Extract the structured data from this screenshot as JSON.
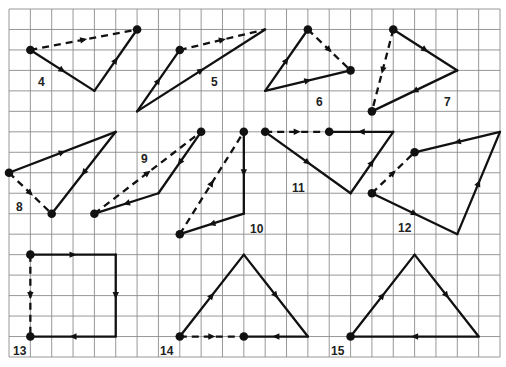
{
  "grid": {
    "columns": 23,
    "rows": 17
  },
  "colors": {
    "ink": "#111111",
    "grid": "#8c8c8c",
    "background": "#ffffff"
  },
  "figures": [
    {
      "label": "4",
      "dots": [
        [
          1,
          2
        ],
        [
          6,
          1
        ]
      ],
      "segments": [
        {
          "from": [
            1,
            2
          ],
          "to": [
            4,
            4
          ],
          "style": "solid"
        },
        {
          "from": [
            4,
            4
          ],
          "to": [
            6,
            1
          ],
          "style": "solid"
        },
        {
          "from": [
            1,
            2
          ],
          "to": [
            6,
            1
          ],
          "style": "dashed"
        }
      ]
    },
    {
      "label": "5",
      "dots": [
        [
          8,
          2
        ]
      ],
      "segments": [
        {
          "from": [
            6,
            5
          ],
          "to": [
            8,
            2
          ],
          "style": "solid"
        },
        {
          "from": [
            6,
            5
          ],
          "to": [
            12,
            1
          ],
          "style": "solid"
        },
        {
          "from": [
            8,
            2
          ],
          "to": [
            12,
            1
          ],
          "style": "dashed"
        }
      ]
    },
    {
      "label": "6",
      "dots": [
        [
          14,
          1
        ],
        [
          16,
          3
        ]
      ],
      "segments": [
        {
          "from": [
            12,
            4
          ],
          "to": [
            14,
            1
          ],
          "style": "solid"
        },
        {
          "from": [
            12,
            4
          ],
          "to": [
            16,
            3
          ],
          "style": "solid"
        },
        {
          "from": [
            14,
            1
          ],
          "to": [
            16,
            3
          ],
          "style": "dashed"
        }
      ]
    },
    {
      "label": "7",
      "dots": [
        [
          18,
          1
        ],
        [
          17,
          5
        ]
      ],
      "segments": [
        {
          "from": [
            18,
            1
          ],
          "to": [
            21,
            3
          ],
          "style": "solid"
        },
        {
          "from": [
            21,
            3
          ],
          "to": [
            17,
            5
          ],
          "style": "solid"
        },
        {
          "from": [
            18,
            1
          ],
          "to": [
            17,
            5
          ],
          "style": "dashed"
        }
      ]
    },
    {
      "label": "8",
      "dots": [
        [
          0,
          8
        ],
        [
          2,
          10
        ]
      ],
      "segments": [
        {
          "from": [
            0,
            8
          ],
          "to": [
            5,
            6
          ],
          "style": "solid"
        },
        {
          "from": [
            5,
            6
          ],
          "to": [
            2,
            10
          ],
          "style": "solid"
        },
        {
          "from": [
            0,
            8
          ],
          "to": [
            2,
            10
          ],
          "style": "dashed"
        }
      ]
    },
    {
      "label": "9",
      "dots": [
        [
          9,
          6
        ],
        [
          4,
          10
        ]
      ],
      "segments": [
        {
          "from": [
            9,
            6
          ],
          "to": [
            7,
            9
          ],
          "style": "solid"
        },
        {
          "from": [
            7,
            9
          ],
          "to": [
            4,
            10
          ],
          "style": "solid"
        },
        {
          "from": [
            4,
            10
          ],
          "to": [
            9,
            6
          ],
          "style": "dashed"
        }
      ]
    },
    {
      "label": "10",
      "dots": [
        [
          11,
          6
        ],
        [
          8,
          11
        ]
      ],
      "segments": [
        {
          "from": [
            11,
            6
          ],
          "to": [
            11,
            10
          ],
          "style": "solid"
        },
        {
          "from": [
            11,
            10
          ],
          "to": [
            8,
            11
          ],
          "style": "solid"
        },
        {
          "from": [
            8,
            11
          ],
          "to": [
            11,
            6
          ],
          "style": "dashed"
        }
      ]
    },
    {
      "label": "11",
      "dots": [
        [
          12,
          6
        ],
        [
          15,
          6
        ]
      ],
      "segments": [
        {
          "from": [
            12,
            6
          ],
          "to": [
            16,
            9
          ],
          "style": "solid"
        },
        {
          "from": [
            16,
            9
          ],
          "to": [
            18,
            6
          ],
          "style": "solid"
        },
        {
          "from": [
            18,
            6
          ],
          "to": [
            15,
            6
          ],
          "style": "solid"
        },
        {
          "from": [
            12,
            6
          ],
          "to": [
            15,
            6
          ],
          "style": "dashed"
        }
      ]
    },
    {
      "label": "12",
      "dots": [
        [
          19,
          7
        ],
        [
          17,
          9
        ]
      ],
      "segments": [
        {
          "from": [
            23,
            6
          ],
          "to": [
            19,
            7
          ],
          "style": "solid"
        },
        {
          "from": [
            17,
            9
          ],
          "to": [
            21,
            11
          ],
          "style": "solid"
        },
        {
          "from": [
            21,
            11
          ],
          "to": [
            23,
            6
          ],
          "style": "solid"
        },
        {
          "from": [
            17,
            9
          ],
          "to": [
            19,
            7
          ],
          "style": "dashed"
        }
      ]
    },
    {
      "label": "13",
      "dots": [
        [
          1,
          12
        ],
        [
          1,
          16
        ]
      ],
      "segments": [
        {
          "from": [
            1,
            12
          ],
          "to": [
            5,
            12
          ],
          "style": "solid"
        },
        {
          "from": [
            5,
            12
          ],
          "to": [
            5,
            16
          ],
          "style": "solid"
        },
        {
          "from": [
            5,
            16
          ],
          "to": [
            1,
            16
          ],
          "style": "solid"
        },
        {
          "from": [
            1,
            12
          ],
          "to": [
            1,
            16
          ],
          "style": "dashed"
        }
      ]
    },
    {
      "label": "14",
      "dots": [
        [
          8,
          16
        ],
        [
          11,
          16
        ]
      ],
      "segments": [
        {
          "from": [
            8,
            16
          ],
          "to": [
            11,
            12
          ],
          "style": "solid"
        },
        {
          "from": [
            11,
            12
          ],
          "to": [
            14,
            16
          ],
          "style": "solid"
        },
        {
          "from": [
            14,
            16
          ],
          "to": [
            11,
            16
          ],
          "style": "solid"
        },
        {
          "from": [
            8,
            16
          ],
          "to": [
            11,
            16
          ],
          "style": "dashed"
        }
      ]
    },
    {
      "label": "15",
      "dots": [
        [
          16,
          16
        ]
      ],
      "segments": [
        {
          "from": [
            16,
            16
          ],
          "to": [
            19,
            12
          ],
          "style": "solid"
        },
        {
          "from": [
            19,
            12
          ],
          "to": [
            22,
            16
          ],
          "style": "solid"
        },
        {
          "from": [
            22,
            16
          ],
          "to": [
            16,
            16
          ],
          "style": "solid"
        }
      ]
    }
  ]
}
